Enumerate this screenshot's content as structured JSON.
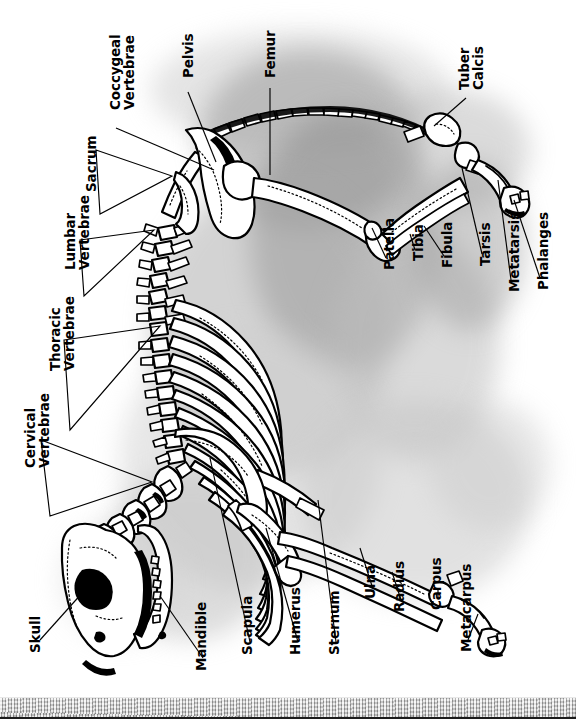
{
  "figure": {
    "orientation": "labels rotated 90 degrees counter-clockwise",
    "ground_label": "ground-strip"
  },
  "colors": {
    "ink": "#000000",
    "bone_fill": "#ffffff",
    "background": "#ffffff",
    "photo_gray_dark": "#7d7d7d",
    "photo_gray_mid": "#b5b5b5",
    "photo_gray_light": "#dcdcdc",
    "ground_gray": "#bdbdbd"
  },
  "labels": [
    {
      "id": "coccygeal-vertebrae",
      "text": "Coccygeal\nVertebrae",
      "lines": [
        "Coccygeal",
        "Vertebrae"
      ],
      "x": 118,
      "y": 108,
      "leader": "single"
    },
    {
      "id": "pelvis",
      "text": "Pelvis",
      "lines": [
        "Pelvis"
      ],
      "x": 190,
      "y": 76,
      "leader": "single"
    },
    {
      "id": "femur",
      "text": "Femur",
      "lines": [
        "Femur"
      ],
      "x": 272,
      "y": 76,
      "leader": "single"
    },
    {
      "id": "tuber-calcis",
      "text": "Tuber\nCalcis",
      "lines": [
        "Tuber",
        "Calcis"
      ],
      "x": 468,
      "y": 88,
      "leader": "single"
    },
    {
      "id": "sacrum",
      "text": "Sacrum",
      "lines": [
        "Sacrum"
      ],
      "x": 91,
      "y": 190,
      "leader": "bracket"
    },
    {
      "id": "lumbar-vertebrae",
      "text": "Lumbar\nVertebrae",
      "lines": [
        "Lumbar",
        "Vertebrae"
      ],
      "x": 73,
      "y": 268,
      "leader": "bracket"
    },
    {
      "id": "patella",
      "text": "Patella",
      "lines": [
        "Patella"
      ],
      "x": 389,
      "y": 268,
      "leader": "single"
    },
    {
      "id": "tibia",
      "text": "Tibia",
      "lines": [
        "Tibia"
      ],
      "x": 418,
      "y": 259,
      "leader": "single"
    },
    {
      "id": "fibula",
      "text": "Fibula",
      "lines": [
        "Fibula"
      ],
      "x": 447,
      "y": 266,
      "leader": "single"
    },
    {
      "id": "tarsis",
      "text": "Tarsis",
      "lines": [
        "Tarsis"
      ],
      "x": 485,
      "y": 264,
      "leader": "single"
    },
    {
      "id": "metatarsis",
      "text": "Metatarsis",
      "lines": [
        "Metatarsis"
      ],
      "x": 514,
      "y": 290,
      "leader": "single"
    },
    {
      "id": "phalanges",
      "text": "Phalanges",
      "lines": [
        "Phalanges"
      ],
      "x": 543,
      "y": 288,
      "leader": "single"
    },
    {
      "id": "thoracic-vertebrae",
      "text": "Thoracic\nVertebrae",
      "lines": [
        "Thoracic",
        "Vertebrae"
      ],
      "x": 58,
      "y": 369,
      "leader": "bracket"
    },
    {
      "id": "cervical-vertebrae",
      "text": "Cervical\nVertebrae",
      "lines": [
        "Cervical",
        "Vertebrae"
      ],
      "x": 33,
      "y": 466,
      "leader": "bracket"
    },
    {
      "id": "skull",
      "text": "Skull",
      "lines": [
        "Skull"
      ],
      "x": 35,
      "y": 651,
      "leader": "single"
    },
    {
      "id": "mandible",
      "text": "Mandible",
      "lines": [
        "Mandible"
      ],
      "x": 201,
      "y": 669,
      "leader": "single"
    },
    {
      "id": "scapula",
      "text": "Scapula",
      "lines": [
        "Scapula"
      ],
      "x": 247,
      "y": 653,
      "leader": "single"
    },
    {
      "id": "humerus",
      "text": "Humerus",
      "lines": [
        "Humerus"
      ],
      "x": 295,
      "y": 653,
      "leader": "single"
    },
    {
      "id": "sternum",
      "text": "Sternum",
      "lines": [
        "Sternum"
      ],
      "x": 334,
      "y": 653,
      "leader": "single"
    },
    {
      "id": "ulna",
      "text": "Ulna",
      "lines": [
        "Ulna"
      ],
      "x": 370,
      "y": 597,
      "leader": "single"
    },
    {
      "id": "radius",
      "text": "Radius",
      "lines": [
        "Radius"
      ],
      "x": 399,
      "y": 610,
      "leader": "single"
    },
    {
      "id": "carpus",
      "text": "Carpus",
      "lines": [
        "Carpus"
      ],
      "x": 436,
      "y": 608,
      "leader": "single"
    },
    {
      "id": "metacarpus",
      "text": "Metacarpus",
      "lines": [
        "Metacarpus"
      ],
      "x": 466,
      "y": 650,
      "leader": "single"
    }
  ]
}
